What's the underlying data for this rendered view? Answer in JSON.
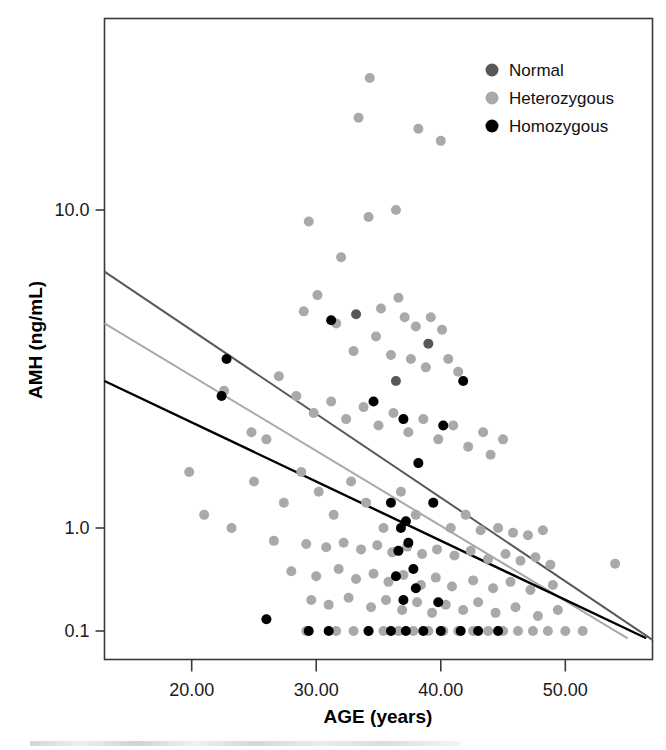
{
  "chart_data": {
    "type": "scatter",
    "title": "",
    "xlabel": "AGE (years)",
    "ylabel": "AMH (ng/mL)",
    "xlim": [
      13.0,
      57.0
    ],
    "ylim": [
      0.085,
      35.0
    ],
    "yscale": "log",
    "xscale": "linear",
    "grid": false,
    "xticks": [
      20,
      30,
      40,
      50
    ],
    "xticklabels": [
      "20.00",
      "30.00",
      "40.00",
      "50.00"
    ],
    "yticks": [
      10.0,
      1.0,
      0.1
    ],
    "yticklabels": [
      "10.0",
      "1.0",
      "0.1"
    ],
    "legend": {
      "position": "top-right",
      "entries": [
        {
          "label": "Normal",
          "color": "#585858",
          "marker": "circle"
        },
        {
          "label": "Heterozygous",
          "color": "#a9a9a9",
          "marker": "circle"
        },
        {
          "label": "Homozygous",
          "color": "#000000",
          "marker": "circle"
        }
      ]
    },
    "marker_size_px": 10,
    "series": [
      {
        "name": "Heterozygous",
        "color": "#a9a9a9",
        "points": [
          [
            34.3,
            26.0
          ],
          [
            33.4,
            19.5
          ],
          [
            38.2,
            18.0
          ],
          [
            40.0,
            16.5
          ],
          [
            29.4,
            9.2
          ],
          [
            34.2,
            9.5
          ],
          [
            36.4,
            10.0
          ],
          [
            32.0,
            7.1
          ],
          [
            30.1,
            5.4
          ],
          [
            29.0,
            4.8
          ],
          [
            31.6,
            4.4
          ],
          [
            36.6,
            5.3
          ],
          [
            35.2,
            4.9
          ],
          [
            37.1,
            4.6
          ],
          [
            38.0,
            4.3
          ],
          [
            39.2,
            4.6
          ],
          [
            40.1,
            4.2
          ],
          [
            34.8,
            4.0
          ],
          [
            33.0,
            3.6
          ],
          [
            36.0,
            3.5
          ],
          [
            37.6,
            3.4
          ],
          [
            38.8,
            3.2
          ],
          [
            40.6,
            3.4
          ],
          [
            41.4,
            3.1
          ],
          [
            27.0,
            3.0
          ],
          [
            22.6,
            2.7
          ],
          [
            24.8,
            2.0
          ],
          [
            26.0,
            1.9
          ],
          [
            28.4,
            2.6
          ],
          [
            29.8,
            2.3
          ],
          [
            31.2,
            2.5
          ],
          [
            32.4,
            2.2
          ],
          [
            33.8,
            2.4
          ],
          [
            35.0,
            2.1
          ],
          [
            36.2,
            2.3
          ],
          [
            37.4,
            2.0
          ],
          [
            38.6,
            2.2
          ],
          [
            39.8,
            1.9
          ],
          [
            41.0,
            2.1
          ],
          [
            42.2,
            1.8
          ],
          [
            43.4,
            2.0
          ],
          [
            44.0,
            1.7
          ],
          [
            45.0,
            1.9
          ],
          [
            19.8,
            1.5
          ],
          [
            21.0,
            1.1
          ],
          [
            23.2,
            1.0
          ],
          [
            25.0,
            1.4
          ],
          [
            27.4,
            1.2
          ],
          [
            28.8,
            1.5
          ],
          [
            30.2,
            1.3
          ],
          [
            31.4,
            1.1
          ],
          [
            32.8,
            1.4
          ],
          [
            34.0,
            1.2
          ],
          [
            35.4,
            1.0
          ],
          [
            36.8,
            1.3
          ],
          [
            38.0,
            1.1
          ],
          [
            39.4,
            1.2
          ],
          [
            40.8,
            1.0
          ],
          [
            42.0,
            1.1
          ],
          [
            43.2,
            0.95
          ],
          [
            44.6,
            1.0
          ],
          [
            45.8,
            0.9
          ],
          [
            47.0,
            0.85
          ],
          [
            48.2,
            0.95
          ],
          [
            26.6,
            0.75
          ],
          [
            29.2,
            0.7
          ],
          [
            30.8,
            0.65
          ],
          [
            32.2,
            0.72
          ],
          [
            33.6,
            0.62
          ],
          [
            34.9,
            0.68
          ],
          [
            36.1,
            0.58
          ],
          [
            37.3,
            0.66
          ],
          [
            38.5,
            0.56
          ],
          [
            39.7,
            0.62
          ],
          [
            41.1,
            0.54
          ],
          [
            42.4,
            0.6
          ],
          [
            43.8,
            0.5
          ],
          [
            45.2,
            0.56
          ],
          [
            46.4,
            0.48
          ],
          [
            47.6,
            0.52
          ],
          [
            48.8,
            0.44
          ],
          [
            54.0,
            0.45
          ],
          [
            28.0,
            0.38
          ],
          [
            30.0,
            0.34
          ],
          [
            31.8,
            0.4
          ],
          [
            33.2,
            0.32
          ],
          [
            34.6,
            0.36
          ],
          [
            35.8,
            0.3
          ],
          [
            37.0,
            0.35
          ],
          [
            38.4,
            0.28
          ],
          [
            39.6,
            0.33
          ],
          [
            40.9,
            0.27
          ],
          [
            42.6,
            0.31
          ],
          [
            44.2,
            0.26
          ],
          [
            45.6,
            0.3
          ],
          [
            47.2,
            0.25
          ],
          [
            49.0,
            0.28
          ],
          [
            29.6,
            0.2
          ],
          [
            31.0,
            0.18
          ],
          [
            32.6,
            0.21
          ],
          [
            34.4,
            0.17
          ],
          [
            35.6,
            0.2
          ],
          [
            36.9,
            0.16
          ],
          [
            38.1,
            0.19
          ],
          [
            39.3,
            0.15
          ],
          [
            40.4,
            0.18
          ],
          [
            41.8,
            0.16
          ],
          [
            43.0,
            0.19
          ],
          [
            44.4,
            0.15
          ],
          [
            46.0,
            0.17
          ],
          [
            47.8,
            0.14
          ],
          [
            49.4,
            0.16
          ],
          [
            29.2,
            0.1
          ],
          [
            31.6,
            0.1
          ],
          [
            33.0,
            0.1
          ],
          [
            34.2,
            0.1
          ],
          [
            35.4,
            0.1
          ],
          [
            36.6,
            0.1
          ],
          [
            37.8,
            0.1
          ],
          [
            39.0,
            0.1
          ],
          [
            40.2,
            0.1
          ],
          [
            41.4,
            0.1
          ],
          [
            42.6,
            0.1
          ],
          [
            43.8,
            0.1
          ],
          [
            45.0,
            0.1
          ],
          [
            46.2,
            0.1
          ],
          [
            47.4,
            0.1
          ],
          [
            48.6,
            0.1
          ],
          [
            50.0,
            0.1
          ],
          [
            51.4,
            0.1
          ]
        ]
      },
      {
        "name": "Normal",
        "color": "#585858",
        "points": [
          [
            33.2,
            4.7
          ],
          [
            39.0,
            3.8
          ],
          [
            36.4,
            2.9
          ]
        ]
      },
      {
        "name": "Homozygous",
        "color": "#000000",
        "points": [
          [
            31.2,
            4.5
          ],
          [
            22.8,
            3.4
          ],
          [
            22.4,
            2.6
          ],
          [
            41.8,
            2.9
          ],
          [
            34.6,
            2.5
          ],
          [
            37.0,
            2.2
          ],
          [
            40.2,
            2.1
          ],
          [
            38.2,
            1.6
          ],
          [
            36.0,
            1.2
          ],
          [
            39.4,
            1.2
          ],
          [
            37.2,
            1.05
          ],
          [
            36.8,
            1.0
          ],
          [
            37.4,
            0.72
          ],
          [
            36.6,
            0.6
          ],
          [
            37.8,
            0.4
          ],
          [
            36.4,
            0.34
          ],
          [
            38.0,
            0.26
          ],
          [
            37.0,
            0.2
          ],
          [
            39.8,
            0.19
          ],
          [
            26.0,
            0.13
          ],
          [
            29.4,
            0.1
          ],
          [
            31.0,
            0.1
          ],
          [
            34.2,
            0.1
          ],
          [
            36.0,
            0.1
          ],
          [
            37.2,
            0.1
          ],
          [
            38.6,
            0.1
          ],
          [
            40.0,
            0.1
          ],
          [
            41.6,
            0.1
          ],
          [
            43.0,
            0.1
          ],
          [
            44.6,
            0.1
          ]
        ]
      }
    ],
    "trendlines": [
      {
        "name": "Normal",
        "color": "#585858",
        "x0": 13.0,
        "y0": 6.4,
        "x1": 57.0,
        "y1": 0.082
      },
      {
        "name": "Heterozygous",
        "color": "#a9a9a9",
        "x0": 13.0,
        "y0": 4.4,
        "x1": 55.0,
        "y1": 0.085
      },
      {
        "name": "Homozygous",
        "color": "#000000",
        "x0": 13.0,
        "y0": 2.9,
        "x1": 56.5,
        "y1": 0.085
      }
    ]
  }
}
